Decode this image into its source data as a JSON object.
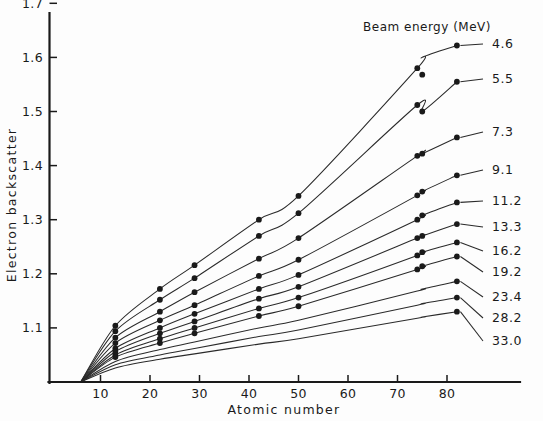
{
  "chart_data": {
    "type": "line",
    "title": "",
    "xlabel": "Atomic number",
    "ylabel": "Electron backscatter",
    "xlim": [
      0,
      86
    ],
    "ylim": [
      1.0,
      1.7
    ],
    "xticks": [
      10,
      20,
      30,
      40,
      50,
      60,
      70,
      80
    ],
    "yticks": [
      1.1,
      1.2,
      1.3,
      1.4,
      1.5,
      1.6,
      1.7
    ],
    "xtick_labels": [
      "10",
      "20",
      "30",
      "40",
      "50",
      "60",
      "70",
      "80"
    ],
    "ytick_labels": [
      "1.1",
      "1.2",
      "1.3",
      "1.4",
      "1.5",
      "1.6",
      "1.7"
    ],
    "grid": false,
    "legend_position": "right-inline-labels",
    "legend_title": "Beam energy (MeV)",
    "marker": "filled-circle",
    "x": [
      6,
      13,
      22,
      29,
      42,
      50,
      74,
      75,
      82
    ],
    "series": [
      {
        "name": "4.6",
        "label": "4.6",
        "values": [
          1.0,
          1.104,
          1.172,
          1.216,
          1.3,
          1.344,
          1.58,
          1.6,
          1.622
        ],
        "points": [
          {
            "x": 13,
            "y": 1.104
          },
          {
            "x": 22,
            "y": 1.172
          },
          {
            "x": 29,
            "y": 1.216
          },
          {
            "x": 42,
            "y": 1.3
          },
          {
            "x": 50,
            "y": 1.344
          },
          {
            "x": 74,
            "y": 1.58
          },
          {
            "x": 75,
            "y": 1.568
          },
          {
            "x": 82,
            "y": 1.622
          }
        ]
      },
      {
        "name": "5.5",
        "label": "5.5",
        "values": [
          1.0,
          1.094,
          1.152,
          1.192,
          1.27,
          1.312,
          1.512,
          1.5,
          1.555
        ],
        "points": [
          {
            "x": 13,
            "y": 1.094
          },
          {
            "x": 22,
            "y": 1.152
          },
          {
            "x": 29,
            "y": 1.192
          },
          {
            "x": 42,
            "y": 1.27
          },
          {
            "x": 50,
            "y": 1.312
          },
          {
            "x": 74,
            "y": 1.512
          },
          {
            "x": 75,
            "y": 1.5
          },
          {
            "x": 82,
            "y": 1.555
          }
        ]
      },
      {
        "name": "7.3",
        "label": "7.3",
        "values": [
          1.0,
          1.082,
          1.13,
          1.166,
          1.228,
          1.266,
          1.418,
          1.422,
          1.452
        ],
        "points": [
          {
            "x": 13,
            "y": 1.082
          },
          {
            "x": 22,
            "y": 1.13
          },
          {
            "x": 29,
            "y": 1.166
          },
          {
            "x": 42,
            "y": 1.228
          },
          {
            "x": 50,
            "y": 1.266
          },
          {
            "x": 74,
            "y": 1.418
          },
          {
            "x": 75,
            "y": 1.422
          },
          {
            "x": 82,
            "y": 1.452
          }
        ]
      },
      {
        "name": "9.1",
        "label": "9.1",
        "values": [
          1.0,
          1.072,
          1.114,
          1.142,
          1.196,
          1.226,
          1.345,
          1.352,
          1.382
        ],
        "points": [
          {
            "x": 13,
            "y": 1.072
          },
          {
            "x": 22,
            "y": 1.114
          },
          {
            "x": 29,
            "y": 1.142
          },
          {
            "x": 42,
            "y": 1.196
          },
          {
            "x": 50,
            "y": 1.226
          },
          {
            "x": 74,
            "y": 1.345
          },
          {
            "x": 75,
            "y": 1.352
          },
          {
            "x": 82,
            "y": 1.382
          }
        ]
      },
      {
        "name": "11.2",
        "label": "11.2",
        "values": [
          1.0,
          1.062,
          1.1,
          1.126,
          1.172,
          1.198,
          1.3,
          1.308,
          1.332
        ],
        "points": [
          {
            "x": 13,
            "y": 1.062
          },
          {
            "x": 22,
            "y": 1.1
          },
          {
            "x": 29,
            "y": 1.126
          },
          {
            "x": 42,
            "y": 1.172
          },
          {
            "x": 50,
            "y": 1.198
          },
          {
            "x": 74,
            "y": 1.3
          },
          {
            "x": 75,
            "y": 1.308
          },
          {
            "x": 82,
            "y": 1.332
          }
        ]
      },
      {
        "name": "13.3",
        "label": "13.3",
        "values": [
          1.0,
          1.056,
          1.09,
          1.112,
          1.154,
          1.176,
          1.266,
          1.27,
          1.292
        ],
        "points": [
          {
            "x": 13,
            "y": 1.056
          },
          {
            "x": 22,
            "y": 1.09
          },
          {
            "x": 29,
            "y": 1.112
          },
          {
            "x": 42,
            "y": 1.154
          },
          {
            "x": 50,
            "y": 1.176
          },
          {
            "x": 74,
            "y": 1.266
          },
          {
            "x": 75,
            "y": 1.27
          },
          {
            "x": 82,
            "y": 1.292
          }
        ]
      },
      {
        "name": "16.2",
        "label": "16.2",
        "values": [
          1.0,
          1.05,
          1.08,
          1.1,
          1.136,
          1.156,
          1.234,
          1.24,
          1.258
        ],
        "points": [
          {
            "x": 13,
            "y": 1.05
          },
          {
            "x": 22,
            "y": 1.08
          },
          {
            "x": 29,
            "y": 1.1
          },
          {
            "x": 42,
            "y": 1.136
          },
          {
            "x": 50,
            "y": 1.156
          },
          {
            "x": 74,
            "y": 1.234
          },
          {
            "x": 75,
            "y": 1.24
          },
          {
            "x": 82,
            "y": 1.258
          }
        ]
      },
      {
        "name": "19.2",
        "label": "19.2",
        "values": [
          1.0,
          1.046,
          1.072,
          1.09,
          1.122,
          1.14,
          1.208,
          1.214,
          1.232
        ],
        "points": [
          {
            "x": 13,
            "y": 1.046
          },
          {
            "x": 22,
            "y": 1.072
          },
          {
            "x": 29,
            "y": 1.09
          },
          {
            "x": 42,
            "y": 1.122
          },
          {
            "x": 50,
            "y": 1.14
          },
          {
            "x": 74,
            "y": 1.208
          },
          {
            "x": 75,
            "y": 1.214
          },
          {
            "x": 82,
            "y": 1.232
          }
        ]
      },
      {
        "name": "23.4",
        "label": "23.4",
        "values": [
          1.0,
          1.038,
          1.06,
          1.074,
          1.1,
          1.114,
          1.168,
          1.172,
          1.186
        ],
        "points": [
          {
            "x": 82,
            "y": 1.186
          }
        ]
      },
      {
        "name": "28.2",
        "label": "28.2",
        "values": [
          1.0,
          1.032,
          1.05,
          1.062,
          1.084,
          1.096,
          1.142,
          1.145,
          1.156
        ],
        "points": [
          {
            "x": 82,
            "y": 1.156
          }
        ]
      },
      {
        "name": "33.0",
        "label": "33.0",
        "values": [
          1.0,
          1.026,
          1.042,
          1.052,
          1.07,
          1.08,
          1.118,
          1.12,
          1.13
        ],
        "points": [
          {
            "x": 82,
            "y": 1.13
          }
        ]
      }
    ]
  }
}
